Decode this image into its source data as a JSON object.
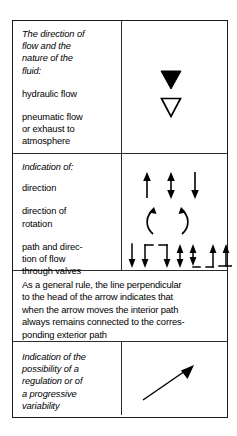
{
  "figure": {
    "type": "symbol-reference-table",
    "columns": [
      "description",
      "symbol"
    ],
    "rows": [
      {
        "id": "flow-direction-nature",
        "heading": "The direction of flow and the nature of the fluid:",
        "entries": [
          {
            "label": "hydraulic flow",
            "symbol": "filled-down-triangle"
          },
          {
            "label": "pneumatic flow or exhaust to atmosphere",
            "symbol": "hollow-down-triangle"
          }
        ]
      },
      {
        "id": "indication-of",
        "heading": "Indication of:",
        "entries": [
          {
            "label": "direction",
            "symbol": "straight-arrows-group"
          },
          {
            "label": "direction of rotation",
            "symbol": "curved-rotation-arrows"
          },
          {
            "label": "path and direction of flow through valves",
            "symbol": "valve-path-arrows"
          }
        ]
      },
      {
        "id": "general-rule-note",
        "paragraph": "As a general rule, the line perpendicular to the head of the arrow indicates that when the arrow moves the interior path always remains connected to the corresponding exterior path"
      },
      {
        "id": "regulation-variability",
        "heading": "Indication of the possibility of a regulation or of a progressive variability",
        "symbol": "diagonal-arrow"
      }
    ]
  },
  "text": {
    "heading_flow": "The direction of flow and the nature of the fluid:",
    "label_hydraulic": "hydraulic flow",
    "label_pneumatic_l1": "pneumatic flow",
    "label_pneumatic_l2": "or exhaust to",
    "label_pneumatic_l3": "atmosphere",
    "heading_indication": "Indication of:",
    "label_direction": "direction",
    "label_rotation_l1": "direction of",
    "label_rotation_l2": "rotation",
    "label_valves_l1": "path and direc-",
    "label_valves_l2": "tion of flow",
    "label_valves_l3": "through valves",
    "paragraph_l1": "As a general rule, the line perpendicular",
    "paragraph_l2": "to the head of the arrow indicates that",
    "paragraph_l3": "when the arrow moves the interior path",
    "paragraph_l4": "always remains connected to the corres-",
    "paragraph_l5": "ponding exterior path",
    "heading_regulation_l1": "Indication of the",
    "heading_regulation_l2": "possibility of a",
    "heading_regulation_l3": "regulation or of",
    "heading_regulation_l4": "a progressive",
    "heading_regulation_l5": "variability",
    "heading_flow_l1": "The direction of",
    "heading_flow_l2": "flow and the",
    "heading_flow_l3": "nature of the",
    "heading_flow_l4": "fluid:"
  },
  "colors": {
    "ink": "#000000",
    "border": "#1a1a1a",
    "inner_border": "#2b2b2b",
    "page_background": "#ffffff"
  },
  "symbols": {
    "filled_down_triangle": "▼",
    "hollow_down_triangle": "▽",
    "straight_arrows": [
      "arrow-up",
      "arrow-double-vertical",
      "arrow-down"
    ],
    "rotation_arrows": [
      "curved-arrow-ccw",
      "curved-arrow-cw"
    ],
    "valve_arrows": [
      "arrow-down-plain",
      "arrow-down-elbow-top-right",
      "arrow-up-elbow-top-left",
      "arrow-double-vertical-plain",
      "arrow-down-tee-bottom",
      "arrow-up-foot-left",
      "arrow-up-cross-bottom"
    ],
    "diagonal_arrow": "arrow-diagonal-up-right"
  }
}
